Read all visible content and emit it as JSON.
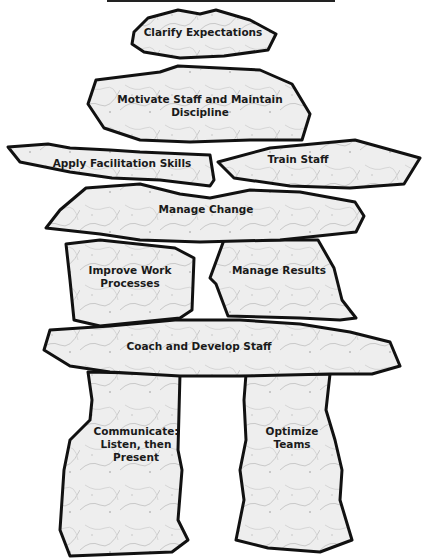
{
  "diagram": {
    "type": "inukshuk",
    "stones": [
      {
        "id": "top",
        "label": "Clarify Expectations"
      },
      {
        "id": "head",
        "label": "Motivate Staff and Maintain Discipline",
        "lines": [
          "Motivate Staff and Maintain",
          "Discipline"
        ]
      },
      {
        "id": "left-arm",
        "label": "Apply Facilitation Skills"
      },
      {
        "id": "right-arm",
        "label": "Train Staff"
      },
      {
        "id": "shoulders",
        "label": "Manage Change"
      },
      {
        "id": "left-torso",
        "label": "Improve Work Processes",
        "lines": [
          "Improve Work",
          "Processes"
        ]
      },
      {
        "id": "right-torso",
        "label": "Manage Results"
      },
      {
        "id": "hips",
        "label": "Coach and Develop Staff"
      },
      {
        "id": "left-leg",
        "label": "Communicate: Listen, then Present",
        "lines": [
          "Communicate:",
          "Listen, then",
          "Present"
        ]
      },
      {
        "id": "right-leg",
        "label": "Optimize Teams",
        "lines": [
          "Optimize",
          "Teams"
        ]
      }
    ],
    "colors": {
      "outline": "#111111",
      "fill": "#ececec",
      "text": "#1a1a1a"
    }
  }
}
